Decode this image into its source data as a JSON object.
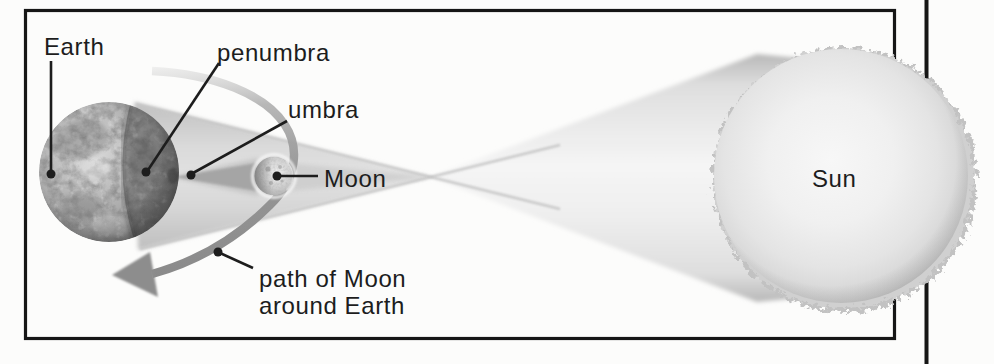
{
  "figure": {
    "kind": "eclipse-shadow-diagram",
    "labels": {
      "earth": "Earth",
      "penumbra": "penumbra",
      "umbra": "umbra",
      "moon": "Moon",
      "sun": "Sun",
      "moon_path_line1": "path of Moon",
      "moon_path_line2": "around Earth"
    },
    "colors": {
      "frame": "#161616",
      "page_edge": "#161616",
      "background": "#fcfcfb",
      "label_text": "#1d1d1d",
      "leader_line": "#1d1d1d",
      "orbit_path": "#8d8d8d",
      "cone_highlight": "#f5f5f5",
      "cone_edge": "#b8b8b8",
      "penumbra_fill": "#d8d8d8",
      "umbra_fill": "#a4a4a4",
      "sun_body": "#ececec",
      "sun_corona": "#c2c2c2",
      "earth_base": "#a9a9a9",
      "moon_body": "#cfcfcf"
    }
  }
}
